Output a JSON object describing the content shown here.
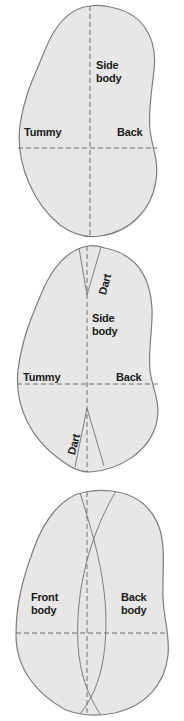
{
  "diagram": {
    "colors": {
      "fill": "#e6e7e6",
      "outline": "#7d7d7d",
      "dash": "#6f6f6f",
      "text": "#1a1a1a"
    },
    "panels": [
      {
        "name": "panel-1",
        "labels": {
          "side_line1": "Side",
          "side_line2": "body",
          "tummy": "Tummy",
          "back": "Back"
        }
      },
      {
        "name": "panel-2",
        "labels": {
          "dart_top": "Dart",
          "side_line1": "Side",
          "side_line2": "body",
          "tummy": "Tummy",
          "back": "Back",
          "dart_bottom": "Dart"
        }
      },
      {
        "name": "panel-3",
        "labels": {
          "front_line1": "Front",
          "front_line2": "body",
          "back_line1": "Back",
          "back_line2": "body"
        }
      }
    ]
  }
}
